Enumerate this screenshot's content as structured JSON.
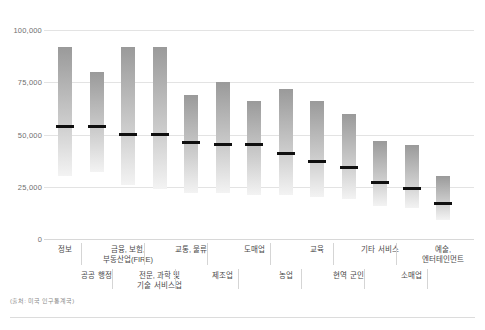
{
  "axis": {
    "y_ticks": [
      "100,000",
      "75,000",
      "50,000",
      "25,000",
      "0"
    ]
  },
  "source_note": "(출처: 미국 인구통계국)",
  "chart_data": {
    "type": "bar",
    "title": "",
    "subtitle": "",
    "xlabel": "",
    "ylabel": "",
    "ylim": [
      0,
      100000
    ],
    "grid": true,
    "legend": "none",
    "note": "Range bars (high-low) with black median marker per industry category",
    "categories": [
      "정보",
      "공공 행정",
      "금융, 보험,\n부동산업(FIRE)",
      "전문, 과학 및\n기술 서비스업",
      "교통, 물류",
      "제조업",
      "도매업",
      "농업",
      "교육",
      "현역 군인",
      "기타 서비스",
      "소매업",
      "예술,\n엔터테인먼트"
    ],
    "series": [
      {
        "name": "중위 소득",
        "values": [
          54000,
          54000,
          50000,
          50000,
          46000,
          45000,
          45000,
          41000,
          37000,
          34000,
          27000,
          24000,
          17000
        ]
      },
      {
        "name": "상위 범위",
        "values": [
          92000,
          80000,
          92000,
          92000,
          69000,
          75000,
          66000,
          72000,
          66000,
          60000,
          47000,
          45000,
          30000
        ]
      },
      {
        "name": "하위 범위",
        "values": [
          30000,
          32000,
          26000,
          24000,
          22000,
          22000,
          21000,
          21000,
          20000,
          19000,
          16000,
          15000,
          9000
        ]
      }
    ],
    "bars": [
      {
        "label": "정보",
        "row": "top",
        "low": 30000,
        "high": 92000,
        "median": 54000
      },
      {
        "label": "공공 행정",
        "row": "bottom",
        "low": 32000,
        "high": 80000,
        "median": 54000
      },
      {
        "label": "금융, 보험,\n부동산업(FIRE)",
        "row": "top",
        "low": 26000,
        "high": 92000,
        "median": 50000
      },
      {
        "label": "전문, 과학 및\n기술 서비스업",
        "row": "bottom",
        "low": 24000,
        "high": 92000,
        "median": 50000
      },
      {
        "label": "교통, 물류",
        "row": "top",
        "low": 22000,
        "high": 69000,
        "median": 46000
      },
      {
        "label": "제조업",
        "row": "bottom",
        "low": 22000,
        "high": 75000,
        "median": 45000
      },
      {
        "label": "도매업",
        "row": "top",
        "low": 21000,
        "high": 66000,
        "median": 45000
      },
      {
        "label": "농업",
        "row": "bottom",
        "low": 21000,
        "high": 72000,
        "median": 41000
      },
      {
        "label": "교육",
        "row": "top",
        "low": 20000,
        "high": 66000,
        "median": 37000
      },
      {
        "label": "현역 군인",
        "row": "bottom",
        "low": 19000,
        "high": 60000,
        "median": 34000
      },
      {
        "label": "기타 서비스",
        "row": "top",
        "low": 16000,
        "high": 47000,
        "median": 27000
      },
      {
        "label": "소매업",
        "row": "bottom",
        "low": 15000,
        "high": 45000,
        "median": 24000
      },
      {
        "label": "예술,\n엔터테인먼트",
        "row": "top",
        "low": 9000,
        "high": 30000,
        "median": 17000
      }
    ]
  }
}
